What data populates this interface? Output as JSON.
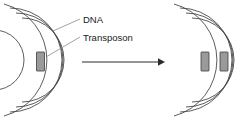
{
  "figure": {
    "type": "biology-diagram",
    "background_color": "#ffffff",
    "labels": [
      {
        "id": "dna",
        "text": "DNA",
        "x": 84,
        "y": 20
      },
      {
        "id": "transposon",
        "text": "Transposon",
        "x": 84,
        "y": 38
      }
    ],
    "leader_lines": [
      {
        "id": "dna-leader",
        "from_x": 82,
        "from_y": 20,
        "to_x": 56,
        "to_y": 32
      },
      {
        "id": "transposon-leader",
        "from_x": 82,
        "from_y": 38,
        "to_x": 49,
        "to_y": 56
      }
    ],
    "left_chromosome": {
      "id": "chromosome-before",
      "center_x": -6,
      "center_y": 60,
      "arc_radii": [
        30,
        38,
        46,
        54
      ],
      "arc_stroke_color": "#4a4a4a",
      "arc_count": 4,
      "transposons": [
        {
          "id": "transposon-original",
          "radius": 46,
          "angle_deg": 0,
          "width": 8,
          "height": 19
        }
      ]
    },
    "right_chromosome": {
      "id": "chromosome-after",
      "center_x": 158,
      "center_y": 60,
      "arc_radii": [
        30,
        38,
        46,
        54
      ],
      "arc_stroke_color": "#4a4a4a",
      "arc_count": 4,
      "transposons": [
        {
          "id": "transposon-copy-1",
          "radius": 46,
          "angle_deg": 0,
          "width": 8,
          "height": 19
        },
        {
          "id": "transposon-copy-2",
          "radius": 54,
          "angle_deg": 0,
          "width": 8,
          "height": 19
        }
      ]
    },
    "arrow": {
      "id": "transition-arrow",
      "x1": 82,
      "y1": 62,
      "x2": 162,
      "y2": 62,
      "color": "#2b2b2b",
      "direction": "right"
    },
    "transposon_fill_color": "#9a9a9a",
    "transposon_stroke_color": "#3c3c3c"
  }
}
